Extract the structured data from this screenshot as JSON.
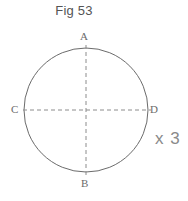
{
  "figure": {
    "title": "Fig 53",
    "annotation": "x 3",
    "stroke_color": "#6b6b6b",
    "dash_color": "#8c8c8c",
    "title_color": "#545454",
    "label_color": "#6b6b6b",
    "background": "#ffffff"
  },
  "labels": {
    "top": "A",
    "bottom": "B",
    "left": "C",
    "right": "D"
  },
  "geometry": {
    "center_x": 86,
    "center_y": 110,
    "radius": 62,
    "vertical_diameter": "A-B",
    "horizontal_diameter": "C-D"
  }
}
